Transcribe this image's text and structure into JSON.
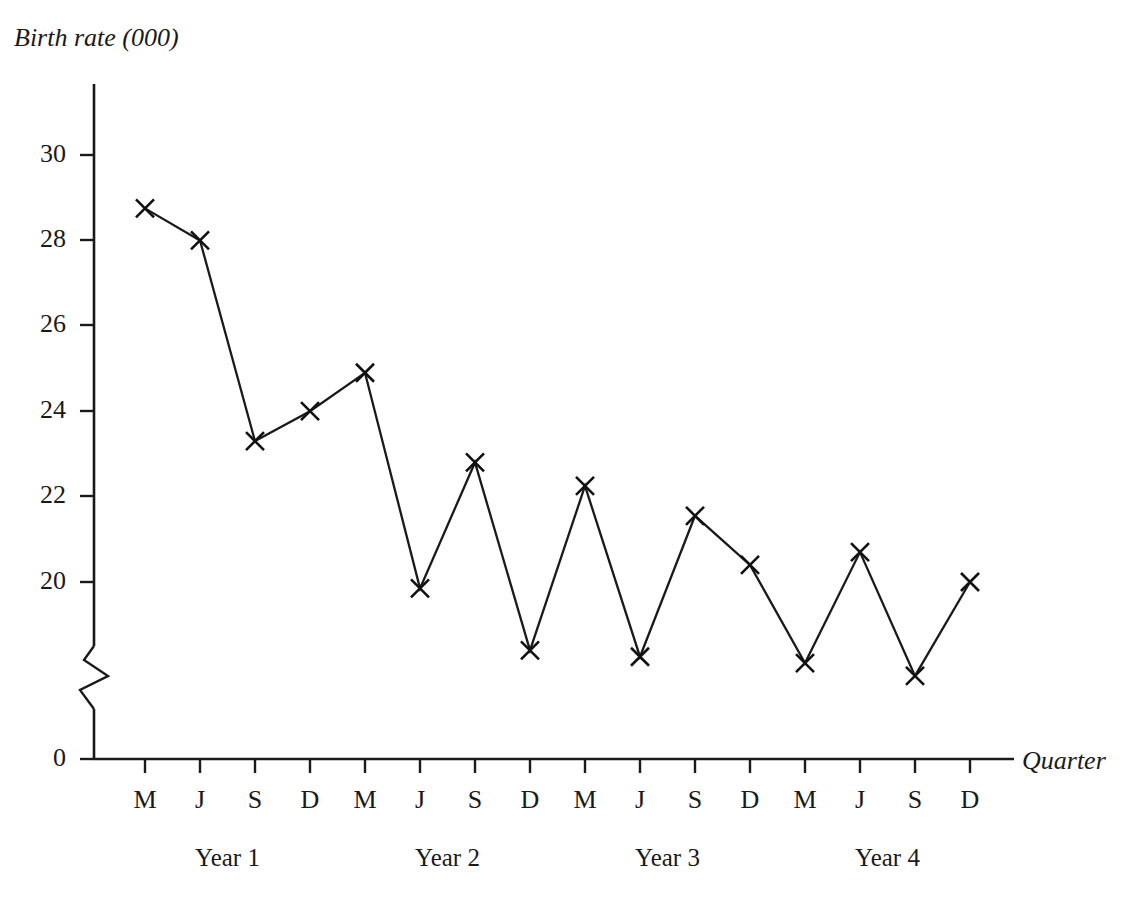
{
  "chart_data": {
    "type": "line",
    "title": "",
    "subtitle": "",
    "ylabel": "Birth rate (000)",
    "xlabel": "Quarter",
    "categories": [
      "M",
      "J",
      "S",
      "D",
      "M",
      "J",
      "S",
      "D",
      "M",
      "J",
      "S",
      "D",
      "M",
      "J",
      "S",
      "D"
    ],
    "values": [
      28.75,
      28.0,
      23.3,
      24.0,
      24.9,
      19.85,
      22.8,
      18.4,
      22.25,
      18.25,
      21.55,
      20.4,
      18.1,
      20.7,
      17.8,
      20.0
    ],
    "series": [
      {
        "name": "Birth rate",
        "values": [
          28.75,
          28.0,
          23.3,
          24.0,
          24.9,
          19.85,
          22.8,
          18.4,
          22.25,
          18.25,
          21.55,
          20.4,
          18.1,
          20.7,
          17.8,
          20.0
        ]
      }
    ],
    "ytick_labels": [
      "30",
      "28",
      "26",
      "24",
      "22",
      "20",
      "0"
    ],
    "ytick_values": [
      30,
      28,
      26,
      24,
      22,
      20,
      0
    ],
    "ylim": [
      17.0,
      31.2
    ],
    "axis_break": true,
    "axis_break_note": "zigzag break on y-axis between 0 and 20",
    "grid": false,
    "legend": false,
    "marker": "x",
    "line_color": "#1a1a1a",
    "group_labels": [
      "Year 1",
      "Year 2",
      "Year 3",
      "Year 4"
    ],
    "group_size": 4
  },
  "axes": {
    "y_title": "Birth rate (000)",
    "x_title": "Quarter"
  },
  "groups": [
    {
      "label": "Year 1"
    },
    {
      "label": "Year 2"
    },
    {
      "label": "Year 3"
    },
    {
      "label": "Year 4"
    }
  ]
}
